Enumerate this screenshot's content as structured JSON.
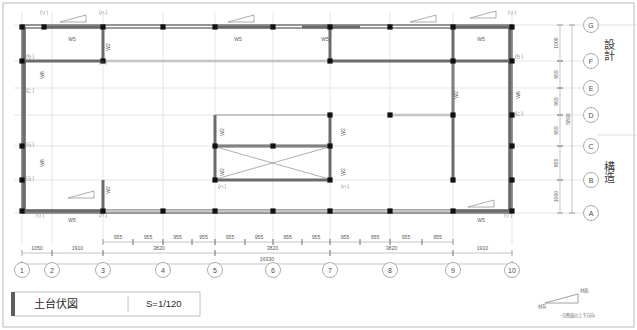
{
  "sheet": {
    "title": "土台伏図",
    "scale": "S=1/120",
    "side_labels": [
      "設計",
      "構造"
    ],
    "north_legend": {
      "upper_label": "材面",
      "lower_label": "材背",
      "caption": "-欠断面の上下方向-"
    }
  },
  "grid": {
    "columns": [
      "1",
      "2",
      "3",
      "4",
      "5",
      "6",
      "7",
      "8",
      "9",
      "10"
    ],
    "column_x": [
      22,
      52,
      103,
      163,
      215,
      273,
      330,
      390,
      453,
      512
    ],
    "rows": [
      "G",
      "F",
      "E",
      "D",
      "C",
      "B",
      "A"
    ],
    "row_y": [
      25,
      61,
      88,
      115,
      146,
      180,
      213
    ],
    "row_letter_x": 591
  },
  "dimensions": {
    "bottom_tier1": [
      {
        "label": "955",
        "x1": 103,
        "x2": 133
      },
      {
        "label": "955",
        "x1": 133,
        "x2": 163
      },
      {
        "label": "955",
        "x1": 163,
        "x2": 192
      },
      {
        "label": "955",
        "x1": 192,
        "x2": 215
      },
      {
        "label": "955",
        "x1": 215,
        "x2": 245
      },
      {
        "label": "955",
        "x1": 245,
        "x2": 273
      },
      {
        "label": "955",
        "x1": 273,
        "x2": 302
      },
      {
        "label": "955",
        "x1": 302,
        "x2": 330
      },
      {
        "label": "955",
        "x1": 330,
        "x2": 360
      },
      {
        "label": "955",
        "x1": 360,
        "x2": 390
      },
      {
        "label": "955",
        "x1": 390,
        "x2": 422
      },
      {
        "label": "955",
        "x1": 422,
        "x2": 453
      }
    ],
    "bottom_tier2": [
      {
        "label": "1050",
        "x1": 22,
        "x2": 52
      },
      {
        "label": "1910",
        "x1": 52,
        "x2": 103
      },
      {
        "label": "3820",
        "x1": 103,
        "x2": 215
      },
      {
        "label": "3820",
        "x1": 215,
        "x2": 330
      },
      {
        "label": "3820",
        "x1": 330,
        "x2": 453
      },
      {
        "label": "1910",
        "x1": 453,
        "x2": 512
      }
    ],
    "bottom_total": {
      "label": "16330",
      "x1": 22,
      "x2": 512
    },
    "right_tier1": [
      {
        "label": "1000",
        "y1": 25,
        "y2": 61
      },
      {
        "label": "955",
        "y1": 61,
        "y2": 88
      },
      {
        "label": "955",
        "y1": 88,
        "y2": 115
      },
      {
        "label": "955",
        "y1": 115,
        "y2": 146
      },
      {
        "label": "955",
        "y1": 146,
        "y2": 180
      },
      {
        "label": "1000",
        "y1": 180,
        "y2": 213
      }
    ],
    "right_total": {
      "label": "5830",
      "y1": 25,
      "y2": 213
    }
  },
  "beam_labels": [
    {
      "text": "W5",
      "x": 72,
      "y": 41,
      "rot": 0
    },
    {
      "text": "W2",
      "x": 110,
      "y": 47,
      "rot": 90
    },
    {
      "text": "W5",
      "x": 238,
      "y": 41,
      "rot": 0
    },
    {
      "text": "W5",
      "x": 325,
      "y": 41,
      "rot": 0
    },
    {
      "text": "W5",
      "x": 481,
      "y": 41,
      "rot": 0
    },
    {
      "text": "W6",
      "x": 44,
      "y": 75,
      "rot": 90
    },
    {
      "text": "W2",
      "x": 458,
      "y": 95,
      "rot": 90
    },
    {
      "text": "W6",
      "x": 520,
      "y": 95,
      "rot": 90
    },
    {
      "text": "W2",
      "x": 224,
      "y": 132,
      "rot": 90
    },
    {
      "text": "W2",
      "x": 345,
      "y": 132,
      "rot": 90
    },
    {
      "text": "W2",
      "x": 224,
      "y": 172,
      "rot": 90
    },
    {
      "text": "W2",
      "x": 345,
      "y": 172,
      "rot": 90
    },
    {
      "text": "W6",
      "x": 44,
      "y": 163,
      "rot": 90
    },
    {
      "text": "W2",
      "x": 110,
      "y": 190,
      "rot": 90
    },
    {
      "text": "W5",
      "x": 72,
      "y": 222,
      "rot": 0
    },
    {
      "text": "W5",
      "x": 481,
      "y": 222,
      "rot": 0
    }
  ],
  "node_marks": [
    {
      "text": "(リ)",
      "x": 44,
      "y": 14
    },
    {
      "text": "(ハ)",
      "x": 103,
      "y": 14
    },
    {
      "text": "(リ)",
      "x": 512,
      "y": 14
    },
    {
      "text": "(ち)",
      "x": 30,
      "y": 58
    },
    {
      "text": "(ち)",
      "x": 519,
      "y": 58
    },
    {
      "text": "(ハ)",
      "x": 103,
      "y": 64
    },
    {
      "text": "(に)",
      "x": 30,
      "y": 92
    },
    {
      "text": "(に)",
      "x": 519,
      "y": 115
    },
    {
      "text": "(ろ)",
      "x": 30,
      "y": 146
    },
    {
      "text": "(ろ)",
      "x": 30,
      "y": 180
    },
    {
      "text": "(ハ)",
      "x": 222,
      "y": 188
    },
    {
      "text": "(ハ)",
      "x": 345,
      "y": 188
    },
    {
      "text": "(リ)",
      "x": 40,
      "y": 217
    },
    {
      "text": "(ハ)",
      "x": 103,
      "y": 217
    },
    {
      "text": "(リ)",
      "x": 508,
      "y": 217
    }
  ]
}
